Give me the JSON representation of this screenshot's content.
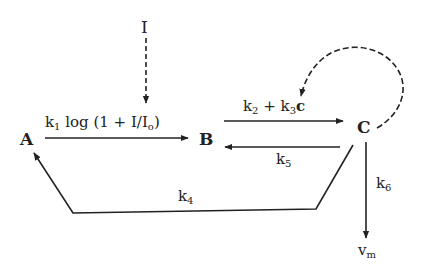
{
  "diagram": {
    "nodes": {
      "A": "A",
      "B": "B",
      "C": "C",
      "I": "I",
      "vm": {
        "base": "v",
        "sub": "m"
      }
    },
    "edges": {
      "A_to_B": {
        "k": "k",
        "sub": "1",
        "rest": " log (1 + I/I",
        "sub2": "o",
        "close": ")"
      },
      "B_to_C": {
        "k1": "k",
        "sub1": "2",
        "plus": " + k",
        "sub2": "3",
        "bold": "c"
      },
      "C_to_B": {
        "k": "k",
        "sub": "5"
      },
      "C_to_A": {
        "k": "k",
        "sub": "4"
      },
      "C_to_vm": {
        "k": "k",
        "sub": "6"
      },
      "I_to_AB": "dashed input",
      "C_feedback": "dashed loop"
    },
    "colors": {
      "ink": "#222222",
      "background": "#ffffff"
    }
  }
}
